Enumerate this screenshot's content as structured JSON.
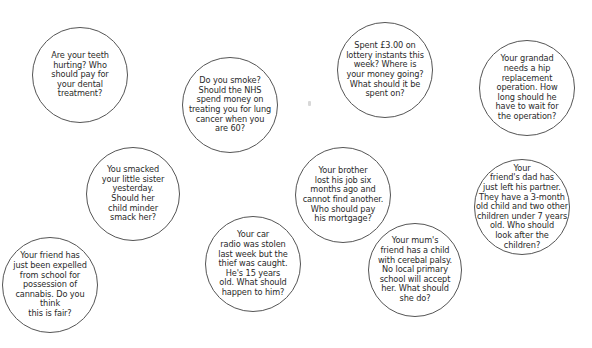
{
  "diagram": {
    "border_color": "#555555",
    "text_color": "#2a2a2a",
    "bubbles": [
      {
        "id": "dental",
        "cx": 80,
        "cy": 75,
        "r": 48,
        "text": "Are your teeth\nhurting? Who\nshould pay for\nyour dental\ntreatment?"
      },
      {
        "id": "smoking",
        "cx": 230,
        "cy": 105,
        "r": 48,
        "text": "Do you smoke?\nShould the NHS\nspend money on\ntreating you for lung\ncancer when you\nare 60?"
      },
      {
        "id": "lottery",
        "cx": 385,
        "cy": 70,
        "r": 48,
        "text": "Spent £3.00 on\nlottery instants this\nweek? Where is\nyour money going?\nWhat should it be\nspent on?"
      },
      {
        "id": "hip-operation",
        "cx": 527,
        "cy": 88,
        "r": 48,
        "text": "Your grandad\nneeds a hip\nreplacement\noperation. How\nlong should he\nhave to wait for\nthe operation?"
      },
      {
        "id": "smacking",
        "cx": 133,
        "cy": 194,
        "r": 47,
        "text": "You smacked\nyour little sister\nyesterday.\nShould her\nchild minder\nsmack her?"
      },
      {
        "id": "mortgage",
        "cx": 343,
        "cy": 195,
        "r": 48,
        "text": "Your brother\nlost his job six\nmonths ago and\ncannot find another.\nWho should pay\nhis mortgage?"
      },
      {
        "id": "car-radio",
        "cx": 253,
        "cy": 264,
        "r": 48,
        "text": "Your car\nradio was stolen\nlast week but the\nthief was caught.\nHe's 15 years\nold. What should\nhappen to him?"
      },
      {
        "id": "expelled",
        "cx": 50,
        "cy": 285,
        "r": 48,
        "text": "Your friend has\njust been expelled\nfrom school for\npossession of\ncannabis. Do you\nthink\nthis is fair?"
      },
      {
        "id": "cerebral-palsy",
        "cx": 415,
        "cy": 270,
        "r": 47,
        "text": "Your mum's\nfriend has a child\nwith cerebal palsy.\nNo local primary\nschool will accept\nher. What should\nshe do?"
      },
      {
        "id": "childcare",
        "cx": 522,
        "cy": 207,
        "r": 48,
        "text": "Your\nfriend's dad has\njust left his partner.\nThey have a 3-month\nold child and two other\nchildren under 7 years\nold. Who should\nlook after the\nchildren?"
      }
    ]
  }
}
